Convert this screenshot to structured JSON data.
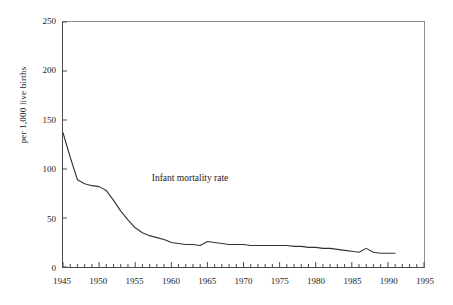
{
  "chart_data": {
    "type": "line",
    "title": "",
    "subtitle": "",
    "xlabel": "",
    "ylabel": "per 1,000 live births",
    "xlim": [
      1945,
      1995
    ],
    "ylim": [
      0,
      250
    ],
    "grid": false,
    "legend": "none",
    "annotations": [
      {
        "text": "Infant mortality rate",
        "x": 1962.5,
        "y": 92
      }
    ],
    "x_ticks": [
      1945,
      1950,
      1955,
      1960,
      1965,
      1970,
      1975,
      1980,
      1985,
      1990,
      1995
    ],
    "x_tick_labels": [
      "1945",
      "1950",
      "1955",
      "1960",
      "1965",
      "1970",
      "1975",
      "1980",
      "1985",
      "1990",
      "1995"
    ],
    "x_minor_tick_step": 1,
    "y_ticks": [
      0,
      50,
      100,
      150,
      200,
      250
    ],
    "y_tick_labels": [
      "0",
      "50",
      "100",
      "150",
      "200",
      "250"
    ],
    "series": [
      {
        "name": "Infant mortality rate",
        "color": "#333333",
        "x": [
          1945,
          1946,
          1947,
          1948,
          1949,
          1950,
          1951,
          1952,
          1953,
          1954,
          1955,
          1956,
          1957,
          1958,
          1959,
          1960,
          1961,
          1962,
          1963,
          1964,
          1965,
          1966,
          1967,
          1968,
          1969,
          1970,
          1971,
          1972,
          1973,
          1974,
          1975,
          1976,
          1977,
          1978,
          1979,
          1980,
          1981,
          1982,
          1983,
          1984,
          1985,
          1986,
          1987,
          1988,
          1989,
          1990,
          1991
        ],
        "values": [
          137,
          112,
          89,
          85,
          83,
          82,
          78,
          68,
          57,
          48,
          40,
          35,
          32,
          30,
          28,
          25,
          24,
          23,
          23,
          22,
          26,
          25,
          24,
          23,
          23,
          23,
          22,
          22,
          22,
          22,
          22,
          22,
          21,
          21,
          20,
          20,
          19,
          19,
          18,
          17,
          16,
          15,
          19,
          15,
          14,
          14,
          14
        ]
      }
    ]
  }
}
